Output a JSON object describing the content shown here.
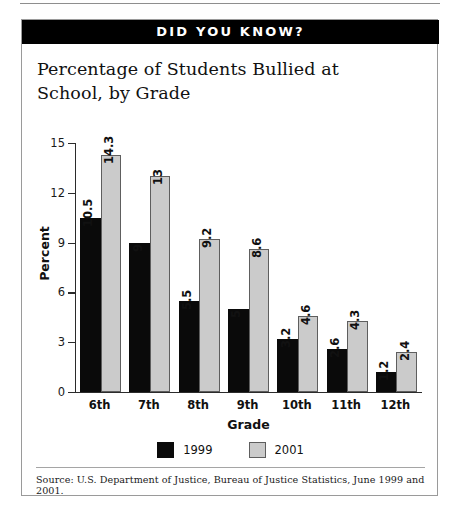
{
  "banner": {
    "label": "DID YOU KNOW?"
  },
  "title": "Percentage of Students Bullied at School, by Grade",
  "legend": {
    "items": [
      {
        "label": "1999",
        "color": "#0a0a0a"
      },
      {
        "label": "2001",
        "color": "#cbcbcb"
      }
    ]
  },
  "source": {
    "text": "Source: U.S. Department of Justice, Bureau of Justice Statistics, June 1999 and 2001."
  },
  "chart_data": {
    "type": "bar",
    "title": "Percentage of Students Bullied at School, by Grade",
    "xlabel": "Grade",
    "ylabel": "Percent",
    "ylim": [
      0,
      15
    ],
    "yticks": [
      0,
      3,
      6,
      9,
      12,
      15
    ],
    "ytick_labels": [
      "0",
      "3",
      "6",
      "9",
      "12",
      "15"
    ],
    "grid": false,
    "legend_position": "bottom-center",
    "categories": [
      "6th",
      "7th",
      "8th",
      "9th",
      "10th",
      "11th",
      "12th"
    ],
    "series": [
      {
        "name": "1999",
        "color": "#0a0a0a",
        "values": [
          10.5,
          9,
          5.5,
          5,
          3.2,
          2.6,
          1.2
        ],
        "labels": [
          "10.5",
          "9",
          "5.5",
          "5",
          "3.2",
          "2.6",
          "1.2"
        ]
      },
      {
        "name": "2001",
        "color": "#cbcbcb",
        "values": [
          14.3,
          13,
          9.2,
          8.6,
          4.6,
          4.3,
          2.4
        ],
        "labels": [
          "14.3",
          "13",
          "9.2",
          "8.6",
          "4.6",
          "4.3",
          "2.4"
        ]
      }
    ]
  }
}
